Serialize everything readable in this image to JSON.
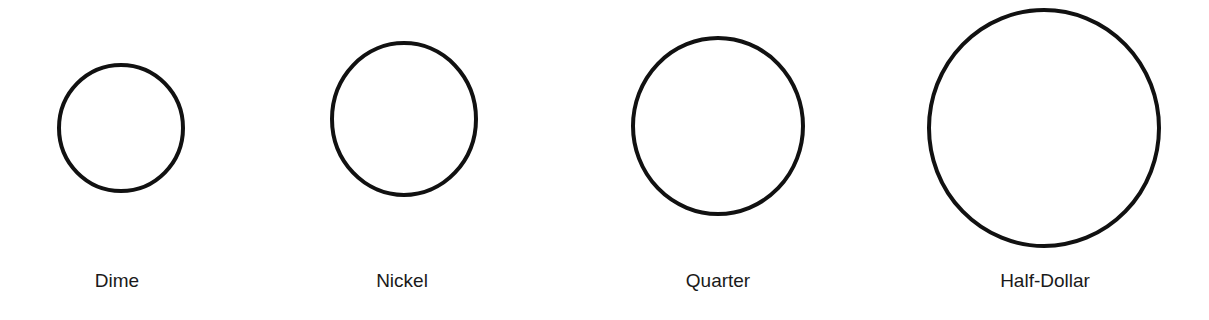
{
  "diagram": {
    "background": "#ffffff",
    "stroke_color": "#111111",
    "stroke_width": 4,
    "coins": [
      {
        "name": "Dime",
        "label": "Dime",
        "cx": 121,
        "cy": 128,
        "rx": 62,
        "ry": 63,
        "label_x": 117
      },
      {
        "name": "Nickel",
        "label": "Nickel",
        "cx": 404,
        "cy": 119,
        "rx": 72,
        "ry": 76,
        "label_x": 402
      },
      {
        "name": "Quarter",
        "label": "Quarter",
        "cx": 718,
        "cy": 126,
        "rx": 85,
        "ry": 88,
        "label_x": 718
      },
      {
        "name": "Half-Dollar",
        "label": "Half-Dollar",
        "cx": 1044,
        "cy": 128,
        "rx": 115,
        "ry": 118,
        "label_x": 1045
      }
    ]
  }
}
